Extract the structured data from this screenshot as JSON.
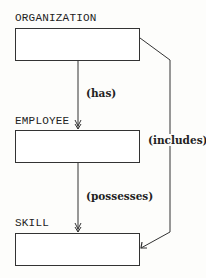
{
  "entities": [
    {
      "name": "ORGANIZATION"
    },
    {
      "name": "EMPLOYEE"
    },
    {
      "name": "SKILL"
    }
  ],
  "relationships": [
    {
      "label": "(has)",
      "from": "ORGANIZATION",
      "to": "EMPLOYEE"
    },
    {
      "label": "(possesses)",
      "from": "EMPLOYEE",
      "to": "SKILL"
    },
    {
      "label": "(includes)",
      "from": "ORGANIZATION",
      "to": "SKILL"
    }
  ],
  "colors": {
    "line": "#333333",
    "background": "#fdfdfb"
  }
}
